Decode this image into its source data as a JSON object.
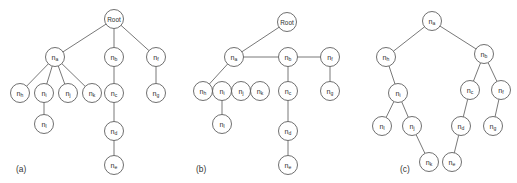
{
  "figure": {
    "name": "tree-representations-figure",
    "background_color": "#ffffff",
    "node_stroke_color": "#4a4a4a",
    "node_fill_color": "#ffffff",
    "edge_color": "#555555",
    "text_color": "#2f2f2f",
    "node_radius": 9.5
  },
  "panels": [
    {
      "id": "a",
      "caption": "(a)",
      "caption_x": 16,
      "caption_y": 172,
      "nodes": [
        {
          "id": "root",
          "label": "Root",
          "base": "Root",
          "sub": "",
          "x": 114,
          "y": 19
        },
        {
          "id": "a",
          "label": "na",
          "base": "n",
          "sub": "a",
          "x": 55,
          "y": 57
        },
        {
          "id": "b",
          "label": "nb",
          "base": "n",
          "sub": "b",
          "x": 114,
          "y": 57
        },
        {
          "id": "f",
          "label": "nf",
          "base": "n",
          "sub": "f",
          "x": 156,
          "y": 57
        },
        {
          "id": "h",
          "label": "nh",
          "base": "n",
          "sub": "h",
          "x": 20,
          "y": 93
        },
        {
          "id": "i",
          "label": "ni",
          "base": "n",
          "sub": "i",
          "x": 44,
          "y": 93
        },
        {
          "id": "j",
          "label": "nj",
          "base": "n",
          "sub": "j",
          "x": 68,
          "y": 93
        },
        {
          "id": "k",
          "label": "nk",
          "base": "n",
          "sub": "k",
          "x": 92,
          "y": 93
        },
        {
          "id": "c",
          "label": "nc",
          "base": "n",
          "sub": "c",
          "x": 114,
          "y": 93
        },
        {
          "id": "g",
          "label": "ng",
          "base": "n",
          "sub": "g",
          "x": 156,
          "y": 93
        },
        {
          "id": "l",
          "label": "nl",
          "base": "n",
          "sub": "l",
          "x": 44,
          "y": 124
        },
        {
          "id": "d",
          "label": "nd",
          "base": "n",
          "sub": "d",
          "x": 114,
          "y": 131
        },
        {
          "id": "e",
          "label": "ne",
          "base": "n",
          "sub": "e",
          "x": 114,
          "y": 165
        }
      ],
      "edges": [
        [
          "root",
          "a"
        ],
        [
          "root",
          "b"
        ],
        [
          "root",
          "f"
        ],
        [
          "a",
          "h"
        ],
        [
          "a",
          "i"
        ],
        [
          "a",
          "j"
        ],
        [
          "a",
          "k"
        ],
        [
          "b",
          "c"
        ],
        [
          "c",
          "d"
        ],
        [
          "d",
          "e"
        ],
        [
          "i",
          "l"
        ],
        [
          "f",
          "g"
        ]
      ]
    },
    {
      "id": "b",
      "caption": "(b)",
      "caption_x": 196,
      "caption_y": 172,
      "nodes": [
        {
          "id": "root",
          "label": "Root",
          "base": "Root",
          "sub": "",
          "x": 287,
          "y": 22
        },
        {
          "id": "a",
          "label": "na",
          "base": "n",
          "sub": "a",
          "x": 234,
          "y": 57
        },
        {
          "id": "b",
          "label": "nb",
          "base": "n",
          "sub": "b",
          "x": 288,
          "y": 57
        },
        {
          "id": "f",
          "label": "nf",
          "base": "n",
          "sub": "f",
          "x": 330,
          "y": 57
        },
        {
          "id": "h",
          "label": "nh",
          "base": "n",
          "sub": "h",
          "x": 203,
          "y": 91
        },
        {
          "id": "i",
          "label": "ni",
          "base": "n",
          "sub": "i",
          "x": 222,
          "y": 91
        },
        {
          "id": "j",
          "label": "nj",
          "base": "n",
          "sub": "j",
          "x": 241,
          "y": 91
        },
        {
          "id": "k",
          "label": "nk",
          "base": "n",
          "sub": "k",
          "x": 260,
          "y": 91
        },
        {
          "id": "c",
          "label": "nc",
          "base": "n",
          "sub": "c",
          "x": 288,
          "y": 91
        },
        {
          "id": "g",
          "label": "ng",
          "base": "n",
          "sub": "g",
          "x": 330,
          "y": 91
        },
        {
          "id": "l",
          "label": "nl",
          "base": "n",
          "sub": "l",
          "x": 222,
          "y": 124
        },
        {
          "id": "d",
          "label": "nd",
          "base": "n",
          "sub": "d",
          "x": 288,
          "y": 131
        },
        {
          "id": "e",
          "label": "ne",
          "base": "n",
          "sub": "e",
          "x": 288,
          "y": 165
        }
      ],
      "edges": [
        [
          "root",
          "a"
        ],
        [
          "a",
          "b"
        ],
        [
          "b",
          "f"
        ],
        [
          "a",
          "h"
        ],
        [
          "h",
          "i"
        ],
        [
          "i",
          "j"
        ],
        [
          "j",
          "k"
        ],
        [
          "b",
          "c"
        ],
        [
          "c",
          "d"
        ],
        [
          "d",
          "e"
        ],
        [
          "i",
          "l"
        ],
        [
          "f",
          "g"
        ]
      ]
    },
    {
      "id": "c",
      "caption": "(c)",
      "caption_x": 400,
      "caption_y": 172,
      "nodes": [
        {
          "id": "a",
          "label": "na",
          "base": "n",
          "sub": "a",
          "x": 432,
          "y": 21
        },
        {
          "id": "h",
          "label": "nh",
          "base": "n",
          "sub": "h",
          "x": 386,
          "y": 57
        },
        {
          "id": "b",
          "label": "nb",
          "base": "n",
          "sub": "b",
          "x": 484,
          "y": 54
        },
        {
          "id": "i",
          "label": "ni",
          "base": "n",
          "sub": "i",
          "x": 398,
          "y": 93
        },
        {
          "id": "c",
          "label": "nc",
          "base": "n",
          "sub": "c",
          "x": 470,
          "y": 90
        },
        {
          "id": "f",
          "label": "nf",
          "base": "n",
          "sub": "f",
          "x": 501,
          "y": 90
        },
        {
          "id": "l",
          "label": "nl",
          "base": "n",
          "sub": "l",
          "x": 382,
          "y": 126
        },
        {
          "id": "j",
          "label": "nj",
          "base": "n",
          "sub": "j",
          "x": 412,
          "y": 126
        },
        {
          "id": "d",
          "label": "nd",
          "base": "n",
          "sub": "d",
          "x": 461,
          "y": 126
        },
        {
          "id": "g",
          "label": "ng",
          "base": "n",
          "sub": "g",
          "x": 493,
          "y": 126
        },
        {
          "id": "k",
          "label": "nk",
          "base": "n",
          "sub": "k",
          "x": 429,
          "y": 162
        },
        {
          "id": "e",
          "label": "ne",
          "base": "n",
          "sub": "e",
          "x": 452,
          "y": 162
        }
      ],
      "edges": [
        [
          "a",
          "h"
        ],
        [
          "a",
          "b"
        ],
        [
          "h",
          "i"
        ],
        [
          "i",
          "l"
        ],
        [
          "i",
          "j"
        ],
        [
          "j",
          "k"
        ],
        [
          "b",
          "c"
        ],
        [
          "b",
          "f"
        ],
        [
          "c",
          "d"
        ],
        [
          "d",
          "e"
        ],
        [
          "f",
          "g"
        ]
      ]
    }
  ]
}
